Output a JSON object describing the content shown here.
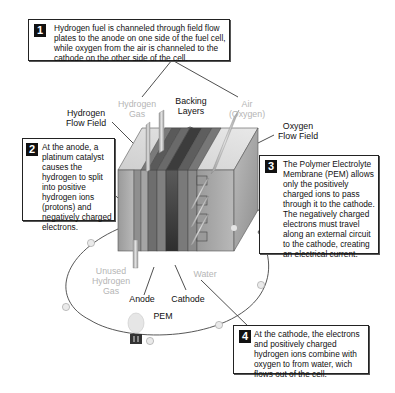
{
  "diagram": {
    "callouts": [
      {
        "number": "1",
        "text": "Hydrogen fuel is channeled through field flow plates to the anode on one side of the fuel cell, while oxygen from the air is channeled to the cathode on the other side of the cell."
      },
      {
        "number": "2",
        "text": "At the anode, a platinum catalyst causes the hydrogen to split into positive hydrogen ions (protons) and negatively charged electrons."
      },
      {
        "number": "3",
        "text": "The Polymer Electrolyte Membrane (PEM) allows only the positively charged ions to pass through it to the cathode. The negatively charged electrons must travel along an external circuit to the cathode, creating an electrical current."
      },
      {
        "number": "4",
        "text": "At the cathode, the electrons and positively charged hydrogen ions combine with oxygen to from water, wich flows out of the cell."
      }
    ],
    "labels": {
      "hydrogen_gas": "Hydrogen Gas",
      "backing_layers": "Backing Layers",
      "air_oxygen": "Air (Oxygen)",
      "hydrogen_flow_field": "Hydrogen Flow Field",
      "oxygen_flow_field": "Oxygen Flow Field",
      "unused_hydrogen_gas": "Unused Hydrogen Gas",
      "water": "Water",
      "anode": "Anode",
      "cathode": "Cathode",
      "pem": "PEM"
    },
    "colors": {
      "outline": "#222222",
      "grey_label": "#b5b5b5",
      "cell_light": "#a9a9a9",
      "cell_dark": "#3a3a3a"
    }
  }
}
